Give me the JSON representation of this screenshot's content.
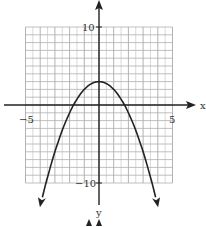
{
  "chart_data": {
    "type": "line",
    "title": "",
    "equation": "y = 3 - x^2",
    "xlabel": "x",
    "ylabel": "y",
    "xlim": [
      -5,
      5
    ],
    "ylim": [
      -10,
      10
    ],
    "grid": true,
    "x_tick_labels": [
      "-5",
      "5"
    ],
    "y_tick_labels": [
      "10",
      "-10"
    ],
    "vertex": [
      0,
      3
    ],
    "x_intercepts": [
      -1.73,
      1.73
    ],
    "series": [
      {
        "name": "parabola",
        "x": [
          -3.9,
          -3,
          -2,
          -1.73,
          -1,
          0,
          1,
          1.73,
          2,
          3,
          3.9
        ],
        "y": [
          -12.2,
          -6,
          -1,
          0,
          2,
          3,
          2,
          0,
          -1,
          -6,
          -12.2
        ]
      }
    ],
    "colors": {
      "curve": "#222222",
      "grid": "#b8b8b8",
      "axis": "#222222"
    }
  },
  "labels": {
    "x_axis": "x",
    "y_axis": "y",
    "x_min": "−5",
    "x_max": "5",
    "y_max": "10",
    "y_min": "−10"
  }
}
